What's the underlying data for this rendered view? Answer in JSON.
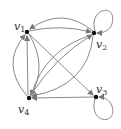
{
  "diagram": {
    "type": "directed-graph",
    "nodes": [
      {
        "id": "v1",
        "label": "v",
        "sub": "1"
      },
      {
        "id": "v2",
        "label": "v",
        "sub": "2"
      },
      {
        "id": "v3",
        "label": "v",
        "sub": "3"
      },
      {
        "id": "v4",
        "label": "v",
        "sub": "4"
      }
    ],
    "edges": [
      {
        "from": "v1",
        "to": "v2"
      },
      {
        "from": "v2",
        "to": "v1"
      },
      {
        "from": "v2",
        "to": "v2"
      },
      {
        "from": "v3",
        "to": "v3"
      },
      {
        "from": "v1",
        "to": "v3"
      },
      {
        "from": "v3",
        "to": "v4"
      },
      {
        "from": "v4",
        "to": "v1"
      },
      {
        "from": "v4",
        "to": "v1"
      },
      {
        "from": "v1",
        "to": "v4"
      },
      {
        "from": "v2",
        "to": "v4"
      },
      {
        "from": "v2",
        "to": "v4"
      },
      {
        "from": "v4",
        "to": "v2"
      }
    ],
    "colors": {
      "edge": "#8a8a8a",
      "node": "#111111",
      "label": "#333333"
    }
  }
}
